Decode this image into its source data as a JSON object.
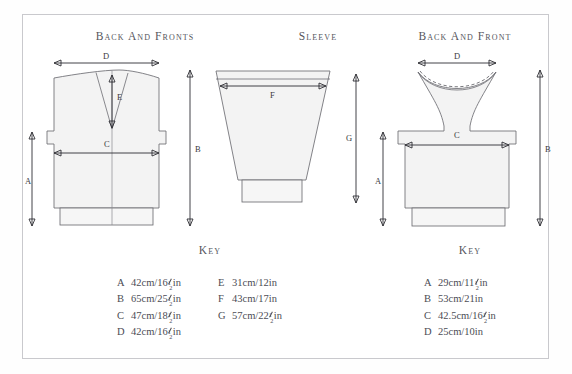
{
  "page": {
    "background_color": "#ffffff",
    "frame_border_color": "#c9c9cd",
    "text_color": "#4c4c54",
    "garment_fill": "#f3f3f3",
    "garment_stroke": "#6d6d73"
  },
  "diagrams": [
    {
      "id": "back-and-fronts",
      "heading": "Back and Fronts",
      "dimension_labels": [
        "A",
        "B",
        "C",
        "D",
        "E"
      ]
    },
    {
      "id": "sleeve",
      "heading": "Sleeve",
      "dimension_labels": [
        "F",
        "G"
      ]
    },
    {
      "id": "back-and-front",
      "heading": "Back and Front",
      "dimension_labels": [
        "A",
        "B",
        "C",
        "D"
      ]
    }
  ],
  "keys": [
    {
      "id": "key-left",
      "title": "Key",
      "columns": [
        {
          "entries": [
            {
              "letter": "A",
              "cm": "42cm",
              "inches_whole": "16",
              "frac_num": "1",
              "frac_den": "2",
              "unit": "in",
              "full": "42cm/16½in"
            },
            {
              "letter": "B",
              "cm": "65cm",
              "inches_whole": "25",
              "frac_num": "1",
              "frac_den": "2",
              "unit": "in",
              "full": "65cm/25½in"
            },
            {
              "letter": "C",
              "cm": "47cm",
              "inches_whole": "18",
              "frac_num": "1",
              "frac_den": "2",
              "unit": "in",
              "full": "47cm/18½in"
            },
            {
              "letter": "D",
              "cm": "42cm",
              "inches_whole": "16",
              "frac_num": "1",
              "frac_den": "2",
              "unit": "in",
              "full": "42cm/16½in"
            }
          ]
        },
        {
          "entries": [
            {
              "letter": "E",
              "cm": "31cm",
              "inches_whole": "12",
              "frac_num": "",
              "frac_den": "",
              "unit": "in",
              "full": "31cm/12in"
            },
            {
              "letter": "F",
              "cm": "43cm",
              "inches_whole": "17",
              "frac_num": "",
              "frac_den": "",
              "unit": "in",
              "full": "43cm/17in"
            },
            {
              "letter": "G",
              "cm": "57cm",
              "inches_whole": "22",
              "frac_num": "1",
              "frac_den": "2",
              "unit": "in",
              "full": "57cm/22½in"
            }
          ]
        }
      ]
    },
    {
      "id": "key-right",
      "title": "Key",
      "columns": [
        {
          "entries": [
            {
              "letter": "A",
              "cm": "29cm",
              "inches_whole": "11",
              "frac_num": "1",
              "frac_den": "2",
              "unit": "in",
              "full": "29cm/11½in"
            },
            {
              "letter": "B",
              "cm": "53cm",
              "inches_whole": "21",
              "frac_num": "",
              "frac_den": "",
              "unit": "in",
              "full": "53cm/21in"
            },
            {
              "letter": "C",
              "cm": "42.5cm",
              "inches_whole": "16",
              "frac_num": "1",
              "frac_den": "2",
              "unit": "in",
              "full": "42.5cm/16½in"
            },
            {
              "letter": "D",
              "cm": "25cm",
              "inches_whole": "10",
              "frac_num": "",
              "frac_den": "",
              "unit": "in",
              "full": "25cm/10in"
            }
          ]
        }
      ]
    }
  ]
}
